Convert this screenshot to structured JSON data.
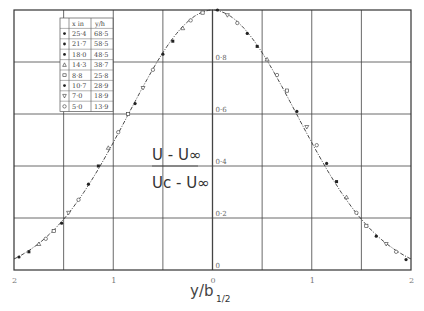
{
  "chart_data": {
    "type": "scatter",
    "title": "",
    "xlabel": "y/b",
    "xlabel_sub": "1/2",
    "ylabel_formula": {
      "numerator": "U - U∞",
      "denominator": "Uc - U∞"
    },
    "x_tick_labels": [
      "2",
      "1",
      "0",
      "1",
      "2"
    ],
    "y_tick_labels": [
      "0",
      "0·2",
      "0·4",
      "0·6",
      "0·8"
    ],
    "xlim": [
      -2,
      2
    ],
    "ylim": [
      0,
      1.0
    ],
    "grid": true,
    "legend_position": "upper-left table",
    "legend": {
      "headers": [
        "x in",
        "y/h"
      ],
      "rows": [
        {
          "marker": "filled-small",
          "x_in": "25·4",
          "y_h": "68·5"
        },
        {
          "marker": "filled-diamond",
          "x_in": "21·7",
          "y_h": "58·5"
        },
        {
          "marker": "filled-square",
          "x_in": "18·0",
          "y_h": "48·5"
        },
        {
          "marker": "open-triangle",
          "x_in": "14·3",
          "y_h": "38·7"
        },
        {
          "marker": "open-square",
          "x_in": "8·8",
          "y_h": "25·8"
        },
        {
          "marker": "filled-circle",
          "x_in": "10·7",
          "y_h": "28·9"
        },
        {
          "marker": "open-inverted-triangle",
          "x_in": "7·0",
          "y_h": "18·9"
        },
        {
          "marker": "open-circle-cross",
          "x_in": "5·0",
          "y_h": "13·9"
        }
      ]
    },
    "curve": {
      "description": "Gaussian-like self-similar wake profile, dashed-dot fitted line",
      "x": [
        -2.0,
        -1.8,
        -1.6,
        -1.4,
        -1.2,
        -1.0,
        -0.8,
        -0.6,
        -0.4,
        -0.2,
        0.0,
        0.2,
        0.4,
        0.6,
        0.8,
        1.0,
        1.2,
        1.4,
        1.6,
        1.8,
        2.0
      ],
      "y": [
        0.04,
        0.09,
        0.15,
        0.24,
        0.36,
        0.5,
        0.64,
        0.78,
        0.89,
        0.97,
        1.0,
        0.97,
        0.89,
        0.78,
        0.64,
        0.5,
        0.36,
        0.24,
        0.15,
        0.09,
        0.04
      ]
    },
    "series_points": {
      "x": [
        -1.95,
        -1.85,
        -1.75,
        -1.68,
        -1.6,
        -1.52,
        -1.45,
        -1.35,
        -1.25,
        -1.15,
        -1.05,
        -0.95,
        -0.85,
        -0.78,
        -0.7,
        -0.6,
        -0.5,
        -0.4,
        -0.3,
        -0.22,
        -0.1,
        0.05,
        0.15,
        0.25,
        0.35,
        0.45,
        0.55,
        0.65,
        0.75,
        0.85,
        0.95,
        1.05,
        1.15,
        1.25,
        1.35,
        1.45,
        1.55,
        1.65,
        1.75,
        1.85,
        1.95
      ],
      "y": [
        0.05,
        0.07,
        0.1,
        0.12,
        0.15,
        0.18,
        0.22,
        0.27,
        0.33,
        0.4,
        0.47,
        0.53,
        0.6,
        0.64,
        0.7,
        0.77,
        0.83,
        0.88,
        0.93,
        0.96,
        0.99,
        1.0,
        0.98,
        0.95,
        0.91,
        0.86,
        0.81,
        0.75,
        0.69,
        0.61,
        0.55,
        0.48,
        0.41,
        0.34,
        0.28,
        0.22,
        0.17,
        0.13,
        0.1,
        0.07,
        0.04
      ]
    }
  }
}
